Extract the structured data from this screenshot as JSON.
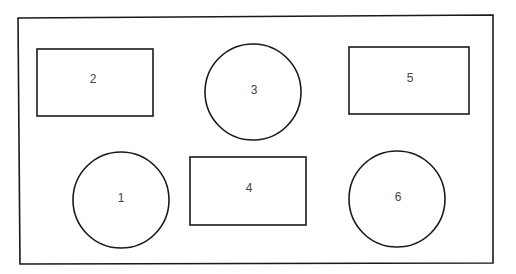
{
  "diagram": {
    "frame": {
      "x1": 18,
      "y1": 17,
      "x2": 493,
      "y2": 264
    },
    "colors": {
      "stroke": "#1a1a1a",
      "label": "#444444",
      "background": "#ffffff"
    },
    "shapes": [
      {
        "id": "2",
        "type": "rect",
        "label": "2",
        "x": 37,
        "y": 49,
        "w": 116,
        "h": 67,
        "label_x": 93,
        "label_y": 79
      },
      {
        "id": "3",
        "type": "circle",
        "label": "3",
        "cx": 253,
        "cy": 92,
        "r": 48,
        "label_x": 254,
        "label_y": 91
      },
      {
        "id": "5",
        "type": "rect",
        "label": "5",
        "x": 349,
        "y": 47,
        "w": 120,
        "h": 67,
        "label_x": 410,
        "label_y": 78
      },
      {
        "id": "1",
        "type": "circle",
        "label": "1",
        "cx": 121,
        "cy": 200,
        "r": 48,
        "label_x": 121,
        "label_y": 198
      },
      {
        "id": "4",
        "type": "rect",
        "label": "4",
        "x": 190,
        "y": 156,
        "w": 116,
        "h": 69,
        "label_x": 249,
        "label_y": 189
      },
      {
        "id": "6",
        "type": "circle",
        "label": "6",
        "cx": 397,
        "cy": 199,
        "r": 48,
        "label_x": 398,
        "label_y": 197
      }
    ]
  }
}
